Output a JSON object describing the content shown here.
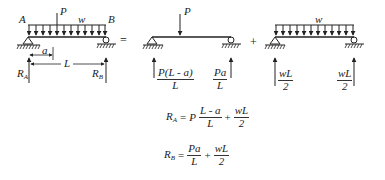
{
  "diagram": {
    "operators": {
      "equals": "=",
      "plus": "+"
    },
    "full_beam": {
      "label_A": "A",
      "label_B": "B",
      "load_point": "P",
      "load_distributed": "w",
      "dim_a": "a",
      "dim_L": "L",
      "reaction_A": "R",
      "reaction_A_sub": "A",
      "reaction_B": "R",
      "reaction_B_sub": "B"
    },
    "point_load_beam": {
      "load_point": "P",
      "reaction_A_num": "P(L - a)",
      "reaction_A_den": "L",
      "reaction_B_num": "Pa",
      "reaction_B_den": "L"
    },
    "distributed_load_beam": {
      "load_distributed": "w",
      "reaction_A_num": "wL",
      "reaction_A_den": "2",
      "reaction_B_num": "wL",
      "reaction_B_den": "2"
    },
    "equations": {
      "RA": {
        "lhs": "R",
        "lhs_sub": "A",
        "eq": "=",
        "coef": "P",
        "frac1_num": "L - a",
        "frac1_den": "L",
        "plus": "+",
        "frac2_num": "wL",
        "frac2_den": "2"
      },
      "RB": {
        "lhs": "R",
        "lhs_sub": "B",
        "eq": "=",
        "frac1_num": "Pa",
        "frac1_den": "L",
        "plus": "+",
        "frac2_num": "wL",
        "frac2_den": "2"
      }
    }
  }
}
